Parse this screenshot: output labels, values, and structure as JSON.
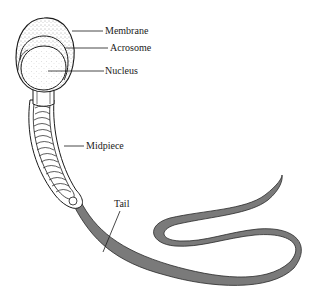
{
  "figure": {
    "labels": {
      "membrane": "Membrane",
      "acrosome": "Acrosome",
      "nucleus": "Nucleus",
      "midpiece": "Midpiece",
      "tail": "Tail"
    },
    "colors": {
      "outline": "#1a1a1a",
      "tail_fill": "#7a7a7a",
      "head_stipple": "#555555",
      "background": "#ffffff"
    }
  }
}
